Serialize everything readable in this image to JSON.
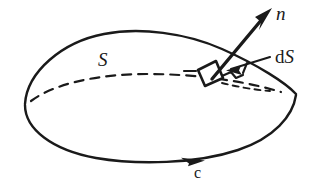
{
  "figure": {
    "domain": "Diagram",
    "background_color": "#ffffff",
    "ink_color": "#1a1a1a",
    "width": 319,
    "height": 185,
    "labels": {
      "normal_vector": "n",
      "surface": "S",
      "area_element_prefix": "d",
      "area_element_symbol": "S",
      "boundary_curve": "c"
    },
    "elements": {
      "surface_dome_name": "surface-dome-outline",
      "rim_dashed_name": "hidden-rim-dashed-arc",
      "rim_front_name": "boundary-curve-front-arc",
      "patch_name": "area-element-patch",
      "normal_arrow_name": "normal-vector-arrow",
      "leader_name": "area-element-leader-line",
      "orientation_arrow_name": "boundary-orientation-arrowhead"
    },
    "geometry": {
      "dome_apex": [
        150,
        31
      ],
      "dome_left": [
        25,
        103
      ],
      "dome_right": [
        296,
        93
      ],
      "rim_bottom": [
        170,
        161
      ],
      "patch_vertices": [
        [
          198,
          70
        ],
        [
          216,
          61
        ],
        [
          223,
          78
        ],
        [
          205,
          86
        ]
      ],
      "normal_arrow_tail": [
        212,
        79
      ],
      "normal_arrow_tip": [
        271,
        9
      ],
      "orientation_arrow_at": [
        196,
        162
      ],
      "leader_from": [
        268,
        58
      ],
      "leader_to": [
        228,
        70
      ]
    }
  }
}
